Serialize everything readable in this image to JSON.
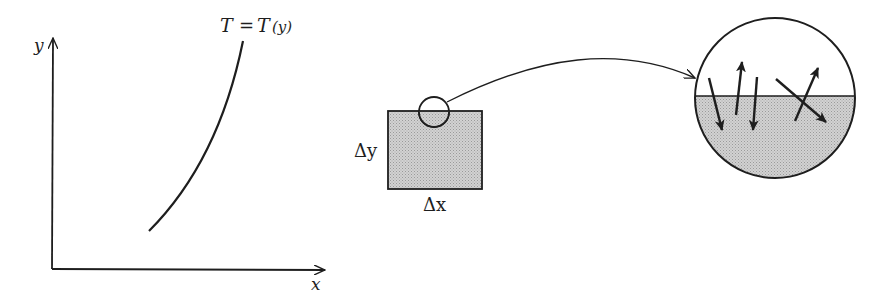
{
  "graph": {
    "y_axis_label": "y",
    "x_axis_label": "x",
    "curve_label_lhs": "T",
    "curve_label_eq": "=",
    "curve_label_rhs": "T",
    "curve_label_arg": "(y)"
  },
  "element": {
    "height_label": "Δy",
    "width_label": "Δx"
  },
  "colors": {
    "ink": "#1e1e1e",
    "shading": "#c8c8c8",
    "background": "#ffffff"
  },
  "magnified_view": {
    "arrow_count": 5,
    "description": "magnified circle showing molecular motion across layer"
  }
}
